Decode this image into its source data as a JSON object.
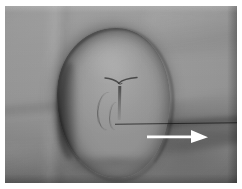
{
  "figure": {
    "domain": "clinical-photograph",
    "caption": "",
    "width_px": 242,
    "height_px": 189,
    "paper_background_color": "#ffffff",
    "plate": {
      "left_px": 5,
      "top_px": 6,
      "width_px": 232,
      "height_px": 177,
      "base_tone_color": "#8e8e8e",
      "description": "Greyscale clinical photograph of skin/drape surface with a large protruding rounded soft-tissue mass at centre-left."
    }
  },
  "subject": {
    "name": "soft-tissue-mass",
    "shape": "rounded-oval",
    "bounds": {
      "left_px": 52,
      "top_px": 22,
      "width_px": 113,
      "height_px": 150
    },
    "fill_color": "#919191",
    "rim_color": "#2e2e2e",
    "surface_markings": [
      {
        "name": "apex-notch-groove",
        "shape": "v-notch"
      },
      {
        "name": "midline-furrow",
        "shape": "vertical-line"
      },
      {
        "name": "lateral-furrow",
        "shape": "curved-line"
      },
      {
        "name": "secondary-lateral-furrow",
        "shape": "curved-line"
      }
    ],
    "shading": {
      "medial-flank-shadow": "#000000",
      "inferior-base-shadow": "#000000",
      "dome-highlight": "#ffffff"
    }
  },
  "background": {
    "name": "skin-and-drape",
    "tone_color": "#949494",
    "features": [
      {
        "name": "left-vertical-crease"
      },
      {
        "name": "left-horizontal-crease"
      },
      {
        "name": "lower-left-fold"
      },
      {
        "name": "top-right-fold"
      },
      {
        "name": "right-diagonal-shadow-fold"
      }
    ]
  },
  "annotations": {
    "arrow": {
      "name": "white-annotation-arrow",
      "color": "#ffffff",
      "direction": "right",
      "label": "",
      "tail_x_px": 145,
      "tip_x_px": 205,
      "center_y_px": 133,
      "shaft_thickness_px": 5,
      "head_length_px": 16,
      "head_height_px": 15,
      "points_at": "soft-tissue-mass"
    },
    "reference_line": {
      "name": "thin-horizontal-reference-line",
      "color": "#141414",
      "start_x_px": 115,
      "end_x_px": 239,
      "y_px": 123,
      "thickness_px": 1
    }
  },
  "render_effects": {
    "film_grain": "enabled",
    "vignette": "enabled",
    "plate_edge_shading": "right-and-bottom-dark, top-light"
  }
}
